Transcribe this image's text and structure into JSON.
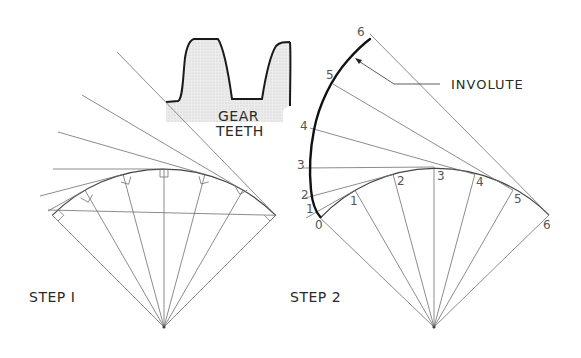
{
  "figure": {
    "gear_label_line1": "GEAR",
    "gear_label_line2": "TEETH",
    "involute_label": "INVOLUTE",
    "step1_label": "STEP I",
    "step2_label": "STEP 2"
  },
  "step2_base_points": [
    "0",
    "1",
    "2",
    "3",
    "4",
    "5",
    "6"
  ],
  "step2_involute_points": [
    "1",
    "2",
    "3",
    "4",
    "5",
    "6"
  ],
  "colors": {
    "line": "#6e6e6e",
    "involute": "#111111",
    "text": "#2a2a2a",
    "gear_fill": "#e4e4e4"
  }
}
